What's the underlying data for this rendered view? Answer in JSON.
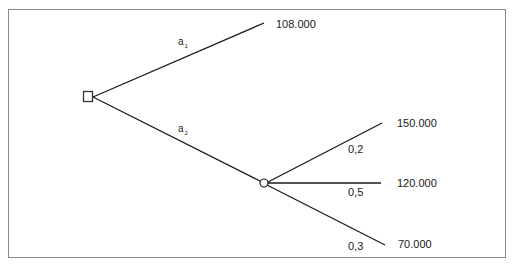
{
  "diagram": {
    "type": "decision-tree",
    "decision_node": {
      "shape": "square",
      "x": 88,
      "y": 97
    },
    "chance_node": {
      "shape": "circle",
      "x": 264,
      "y": 183
    },
    "actions": [
      {
        "name": "a",
        "subscript": "1",
        "outcome": "108.000"
      },
      {
        "name": "a",
        "subscript": "2"
      }
    ],
    "chance_branches": [
      {
        "probability": "0,2",
        "outcome": "150.000"
      },
      {
        "probability": "0,5",
        "outcome": "120.000"
      },
      {
        "probability": "0,3",
        "outcome": "70.000"
      }
    ],
    "colors": {
      "line": "#1a1a1a",
      "frame": "#8a8a8a",
      "background": "#ffffff"
    }
  }
}
